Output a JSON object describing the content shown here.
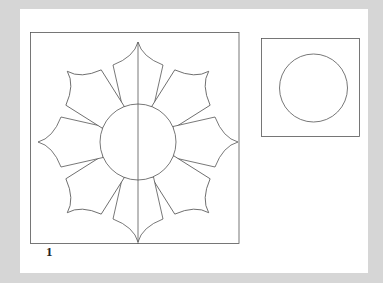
{
  "figure": {
    "label": "1",
    "stroke_color": "#555555",
    "page_color": "#ffffff",
    "background_color": "#d6d6d6"
  },
  "templates": [
    {
      "name": "flower-block",
      "shape": "square",
      "contents": "eight-petal flower with center circle and vertical center line",
      "petal_count": 8
    },
    {
      "name": "circle-template",
      "shape": "square",
      "contents": "circle"
    }
  ]
}
